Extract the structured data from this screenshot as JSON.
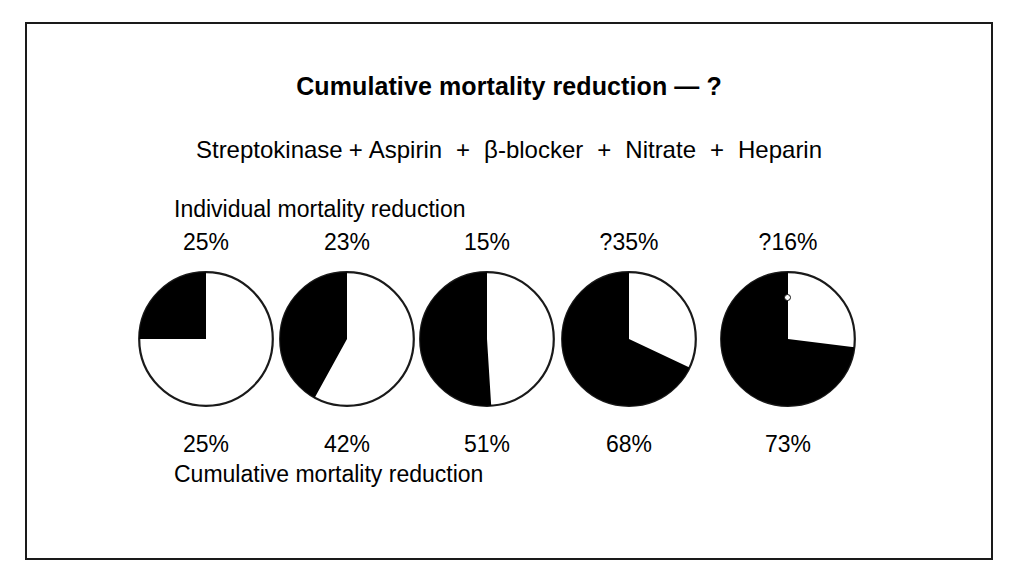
{
  "figure": {
    "title": "Cumulative mortality reduction — ?",
    "individual_label": "Individual mortality reduction",
    "cumulative_label": "Cumulative mortality reduction",
    "plus_symbol": "+",
    "border_color": "#1a1a1a",
    "fill_color": "#000000",
    "background_color": "#ffffff"
  },
  "regimen": {
    "drugs": [
      {
        "name": "Streptokinase"
      },
      {
        "name": "Aspirin"
      },
      {
        "name": "β-blocker"
      },
      {
        "name": "Nitrate"
      },
      {
        "name": "Heparin"
      }
    ]
  },
  "chart_data": {
    "type": "pie",
    "title": "Cumulative mortality reduction — ?",
    "categories": [
      "Streptokinase",
      "Aspirin",
      "β-blocker",
      "Nitrate",
      "Heparin"
    ],
    "series": [
      {
        "name": "Individual mortality reduction",
        "labels": [
          "25%",
          "23%",
          "15%",
          "?35%",
          "?16%"
        ],
        "values": [
          25,
          23,
          15,
          35,
          16
        ],
        "uncertain": [
          false,
          false,
          false,
          true,
          true
        ]
      },
      {
        "name": "Cumulative mortality reduction",
        "labels": [
          "25%",
          "42%",
          "51%",
          "68%",
          "73%"
        ],
        "values": [
          25,
          42,
          51,
          68,
          73
        ],
        "uncertain": [
          false,
          false,
          false,
          false,
          false
        ]
      }
    ],
    "pies": [
      {
        "drug": "Streptokinase",
        "individual_label": "25%",
        "individual_value": 25,
        "cumulative_label": "25%",
        "cumulative_value": 25,
        "filled_fraction": 0.25
      },
      {
        "drug": "Aspirin",
        "individual_label": "23%",
        "individual_value": 23,
        "cumulative_label": "42%",
        "cumulative_value": 42,
        "filled_fraction": 0.42
      },
      {
        "drug": "β-blocker",
        "individual_label": "15%",
        "individual_value": 15,
        "cumulative_label": "51%",
        "cumulative_value": 51,
        "filled_fraction": 0.51
      },
      {
        "drug": "Nitrate",
        "individual_label": "?35%",
        "individual_value": 35,
        "cumulative_label": "68%",
        "cumulative_value": 68,
        "filled_fraction": 0.68
      },
      {
        "drug": "Heparin",
        "individual_label": "?16%",
        "individual_value": 16,
        "cumulative_label": "73%",
        "cumulative_value": 73,
        "filled_fraction": 0.73
      }
    ],
    "ylabel": "",
    "xlabel": "",
    "legend": "none",
    "grid": false,
    "note": "Each pie shows the cumulative mortality reduction as a black sector filled counter-clockwise from 12 o'clock."
  },
  "layout": {
    "pie_centers_x": [
      204,
      345,
      485,
      627,
      786
    ],
    "pie_center_y": 337,
    "pie_radius": 68
  }
}
